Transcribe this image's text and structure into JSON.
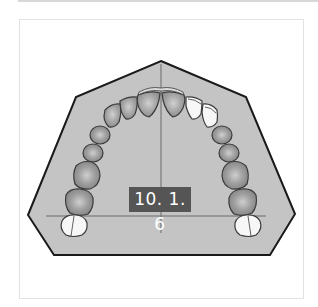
{
  "figure": {
    "label": "10. 1. 6",
    "colors": {
      "base_fill": "#c4c4c4",
      "base_stroke": "#1a1a1a",
      "tooth_fill": "#a8a8a8",
      "tooth_stroke": "#3a3a3a",
      "highlight_tooth_fill": "#f7f7f7",
      "label_bg": "#555555",
      "label_text": "#ffffff",
      "reference_line": "#6a6a6a"
    },
    "reference_lines": {
      "midline": "vertical",
      "transverse": "horizontal"
    }
  }
}
